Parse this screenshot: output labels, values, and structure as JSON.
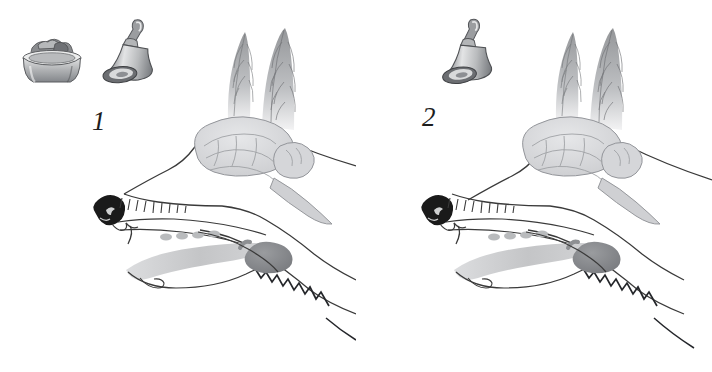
{
  "figure": {
    "background_color": "#ffffff",
    "width": 712,
    "height": 372,
    "panel_count": 2
  },
  "palette": {
    "ink": "#3a3a3a",
    "ink_dark": "#1d1d1d",
    "nose_black": "#1a1a1a",
    "brain_fill": "#d9dadc",
    "brain_line": "#9a9ca0",
    "tongue_fill": "#c9cacb",
    "gland_fill": "#8e9093",
    "fur_gray": "#8d8f92",
    "metal_light": "#d7d8d9",
    "metal_mid": "#a8aaac",
    "metal_dark": "#6e7073",
    "food_gray": "#7c7e81"
  },
  "panels": [
    {
      "id": "panel-1",
      "number_label": "1",
      "stimuli": [
        {
          "name": "food-bowl",
          "label": "food bowl",
          "present": true,
          "x": 18,
          "y": 33
        },
        {
          "name": "bell",
          "label": "bell",
          "present": true,
          "x": 104,
          "y": 18
        }
      ],
      "anatomy": [
        {
          "name": "ear-left",
          "label": "left ear"
        },
        {
          "name": "ear-right",
          "label": "right ear"
        },
        {
          "name": "brain",
          "label": "brain"
        },
        {
          "name": "brainstem",
          "label": "brainstem"
        },
        {
          "name": "spinal-cord",
          "label": "spinal cord"
        },
        {
          "name": "nose",
          "label": "nose"
        },
        {
          "name": "teeth",
          "label": "teeth"
        },
        {
          "name": "tongue",
          "label": "tongue"
        },
        {
          "name": "taste-buds",
          "label": "taste buds"
        },
        {
          "name": "salivary-gland",
          "label": "salivary gland"
        }
      ]
    },
    {
      "id": "panel-2",
      "number_label": "2",
      "stimuli": [
        {
          "name": "food-bowl",
          "label": "food bowl",
          "present": false
        },
        {
          "name": "bell",
          "label": "bell",
          "present": true,
          "x": 86,
          "y": 18
        }
      ],
      "anatomy": [
        {
          "name": "ear-left",
          "label": "left ear"
        },
        {
          "name": "ear-right",
          "label": "right ear"
        },
        {
          "name": "brain",
          "label": "brain"
        },
        {
          "name": "brainstem",
          "label": "brainstem"
        },
        {
          "name": "spinal-cord",
          "label": "spinal cord"
        },
        {
          "name": "nose",
          "label": "nose"
        },
        {
          "name": "teeth",
          "label": "teeth"
        },
        {
          "name": "tongue",
          "label": "tongue"
        },
        {
          "name": "taste-buds",
          "label": "taste buds"
        },
        {
          "name": "salivary-gland",
          "label": "salivary gland"
        }
      ]
    }
  ]
}
